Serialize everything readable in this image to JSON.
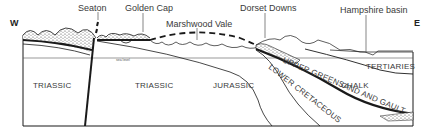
{
  "figure": {
    "type": "geological-cross-section",
    "orientation": {
      "west": "W",
      "east": "E"
    },
    "place_labels": [
      {
        "id": "seaton",
        "text": "Seaton"
      },
      {
        "id": "golden-cap",
        "text": "Golden Cap"
      },
      {
        "id": "marshwood-vale",
        "text": "Marshwood Vale"
      },
      {
        "id": "dorset-downs",
        "text": "Dorset Downs"
      },
      {
        "id": "hampshire-basin",
        "text": "Hampshire basin"
      }
    ],
    "reference_line": {
      "text": "sea level"
    },
    "strata": [
      {
        "id": "triassic-west",
        "text": "TRIASSIC"
      },
      {
        "id": "triassic-east",
        "text": "TRIASSIC"
      },
      {
        "id": "jurassic",
        "text": "JURASSIC"
      },
      {
        "id": "upper-greensand-gault",
        "text": "UPPER GREENSAND AND GAULT"
      },
      {
        "id": "lower-cretaceous",
        "text": "LOWER CRETACEOUS"
      },
      {
        "id": "chalk",
        "text": "CHALK"
      },
      {
        "id": "tertiaries",
        "text": "TERTIARIES"
      }
    ],
    "colors": {
      "line": "#1a1a1a",
      "text": "#3a3a3a",
      "background": "#ffffff"
    }
  }
}
